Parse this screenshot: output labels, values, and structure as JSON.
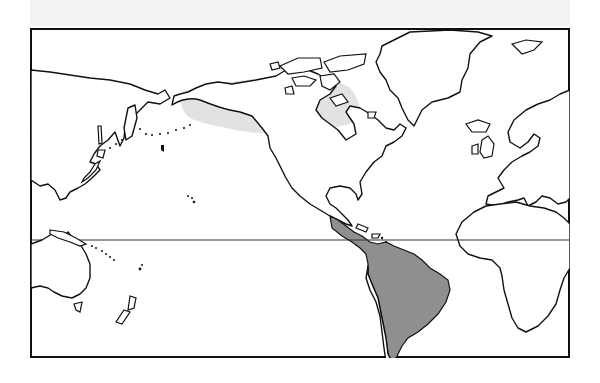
{
  "map": {
    "projection": "equirectangular world map centered on the Americas (Pacific-centered)",
    "frame": {
      "x": 31,
      "y": 29,
      "width": 538,
      "height": 328
    },
    "equator_y": 240,
    "legend": [],
    "title": "",
    "regions": [
      {
        "name": "northern-north-america-range",
        "label": "Alaska and northern Canada (boreal band)",
        "color": "#e2e2e2"
      },
      {
        "name": "neotropical-range",
        "label": "Central America and South America east of the Andes",
        "color": "#8f8f8f"
      }
    ],
    "colors": {
      "background": "#ffffff",
      "top_band": "#f3f3f3",
      "coastline": "#111111",
      "light_range": "#e2e2e2",
      "dark_range": "#8f8f8f"
    }
  }
}
